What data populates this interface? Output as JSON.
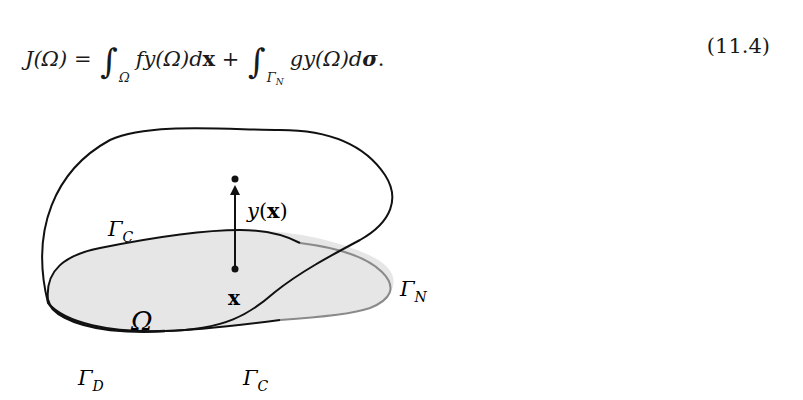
{
  "equation": {
    "lhs": "J(Ω)",
    "equals": "=",
    "integral1_domain": "Ω",
    "integrand1": "fy(Ω)d",
    "differential1": "x",
    "plus": "+",
    "integral2_domain": "Γ",
    "integral2_domain_sub": "N",
    "integrand2": "gy(Ω)d",
    "differential2": "σ",
    "terminator": ".",
    "number": "(11.4)"
  },
  "figure": {
    "domain_label": "Ω",
    "point_label": "x",
    "displacement_label": "y(x)",
    "boundary_labels": [
      {
        "symbol": "Γ",
        "sub": "C",
        "position": "top-contact"
      },
      {
        "symbol": "Γ",
        "sub": "N",
        "position": "right-neumann"
      },
      {
        "symbol": "Γ",
        "sub": "D",
        "position": "bottom-dirichlet"
      },
      {
        "symbol": "Γ",
        "sub": "C",
        "position": "bottom-contact"
      }
    ],
    "colors": {
      "domain_fill": "#e6e6e6",
      "outline": "#111111",
      "neumann_boundary": "#8a8a8a"
    }
  }
}
